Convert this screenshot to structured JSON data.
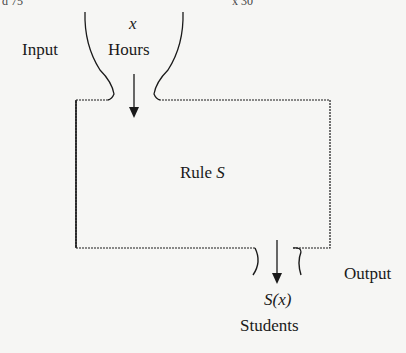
{
  "diagram": {
    "input_label": "Input",
    "input_var": "x",
    "input_unit": "Hours",
    "rule_label": "Rule",
    "rule_name": "S",
    "output_label": "Output",
    "output_var": "S(x)",
    "output_unit": "Students"
  },
  "page_fragments": {
    "top_left": "d 75",
    "top_right": "x 30"
  },
  "colors": {
    "ink": "#1a1a1a",
    "paper": "#f6f6f4"
  }
}
